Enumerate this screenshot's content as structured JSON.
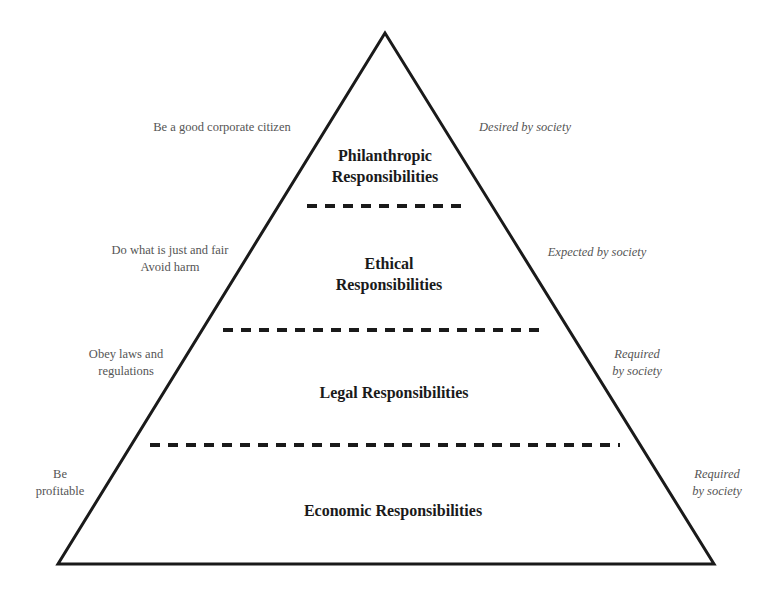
{
  "diagram": {
    "type": "pyramid",
    "colors": {
      "stroke": "#1a1a1a",
      "label": "#1a1a1a",
      "note": "#555555",
      "background": "#ffffff"
    },
    "layers": [
      {
        "id": "philanthropic",
        "label": "Philanthropic\nResponsibilities",
        "left_note": "Be a good corporate citizen",
        "right_note": "Desired by society"
      },
      {
        "id": "ethical",
        "label": "Ethical\nResponsibilities",
        "left_note": "Do what is just and fair\nAvoid harm",
        "right_note": "Expected by society"
      },
      {
        "id": "legal",
        "label": "Legal Responsibilities",
        "left_note": "Obey laws and\nregulations",
        "right_note": "Required\nby society"
      },
      {
        "id": "economic",
        "label": "Economic Responsibilities",
        "left_note": "Be\nprofitable",
        "right_note": "Required\nby society"
      }
    ]
  }
}
